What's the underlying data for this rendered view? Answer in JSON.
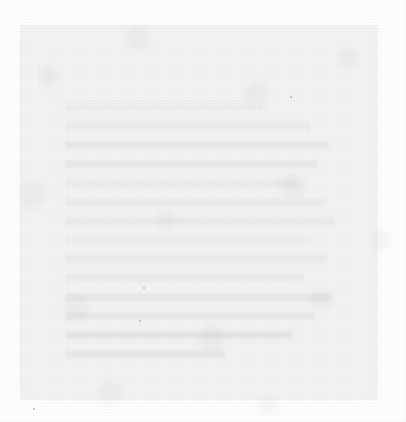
{
  "document": {
    "legibility": "unreadable",
    "legibility_note": "Overexposed / washed-out scan. No glyphs are resolvable at any zoom level; ink contrast is within a few grey levels of the paper.",
    "readable_text_found": "none",
    "page_background_color": "#fefefe",
    "scan_block_color": "#f2f2f2",
    "ghost_text_color": "#e2e2e2",
    "speck_color": "#9a9a9a",
    "scan_block": {
      "left": 20,
      "top": 25,
      "width": 358,
      "height": 375
    },
    "text_column": {
      "left": 65,
      "top": 103,
      "width": 278,
      "line_pitch": 19,
      "line_count": 14
    },
    "lines": [
      {
        "text": null,
        "width_pct": 72,
        "faintness": 1
      },
      {
        "text": null,
        "width_pct": 88,
        "faintness": 2
      },
      {
        "text": null,
        "width_pct": 95,
        "faintness": 3
      },
      {
        "text": null,
        "width_pct": 91,
        "faintness": 3
      },
      {
        "text": null,
        "width_pct": 84,
        "faintness": 2
      },
      {
        "text": null,
        "width_pct": 93,
        "faintness": 2
      },
      {
        "text": null,
        "width_pct": 97,
        "faintness": 2
      },
      {
        "text": null,
        "width_pct": 89,
        "faintness": 1
      },
      {
        "text": null,
        "width_pct": 94,
        "faintness": 2
      },
      {
        "text": null,
        "width_pct": 86,
        "faintness": 2
      },
      {
        "text": null,
        "width_pct": 96,
        "faintness": 3
      },
      {
        "text": null,
        "width_pct": 90,
        "faintness": 3
      },
      {
        "text": null,
        "width_pct": 82,
        "faintness": 4
      },
      {
        "text": null,
        "width_pct": 58,
        "faintness": 3
      }
    ],
    "specks": [
      {
        "left": 143,
        "top": 287
      },
      {
        "left": 139,
        "top": 320
      },
      {
        "left": 33,
        "top": 408
      },
      {
        "left": 290,
        "top": 96
      }
    ]
  }
}
